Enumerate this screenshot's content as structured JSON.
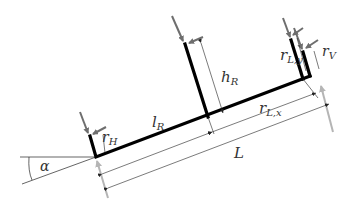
{
  "diagram": {
    "type": "inclined-beam-force-diagram",
    "labels": {
      "alpha": "α",
      "l_R": "l",
      "l_R_sub": "R",
      "h_R": "h",
      "h_R_sub": "R",
      "r_H": "r",
      "r_H_sub": "H",
      "r_V": "r",
      "r_V_sub": "V",
      "r_Lx": "r",
      "r_Lx_sub": "L,x",
      "r_Ly": "r",
      "r_Ly_sub": "L,y",
      "L": "L"
    },
    "colors": {
      "beam": "#000000",
      "force_arrow": "#6e6e6e",
      "reaction_arrow": "#b5b5b5",
      "dimension_line": "#222222",
      "label": "#333333"
    }
  }
}
